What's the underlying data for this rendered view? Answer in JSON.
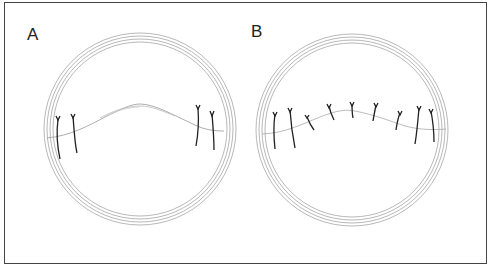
{
  "figure": {
    "panels": [
      {
        "label": "A",
        "description": "Ring with wavy line and four sutures (two at each side)"
      },
      {
        "label": "B",
        "description": "Ring with wavy line and nine evenly distributed sutures"
      }
    ],
    "colors": {
      "frame": "#444444",
      "rings": "#999999",
      "sutures": "#222222",
      "line": "#aaaaaa"
    }
  }
}
